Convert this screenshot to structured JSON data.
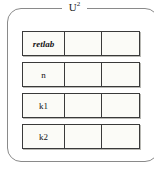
{
  "group": {
    "legend_base": "U",
    "legend_sup": "2",
    "legend_full": "U²",
    "border_color": "#8a8a8a",
    "background": "#ffffff"
  },
  "table": {
    "cell_border_color": "#3a3a3a",
    "cell_background": "#fbfbf7",
    "column_count": 3,
    "columns": [
      "",
      "",
      ""
    ],
    "rows": [
      {
        "label": "retlab",
        "label_style": "italic",
        "cells": [
          "retlab",
          "",
          ""
        ]
      },
      {
        "label": "n",
        "label_style": "normal",
        "cells": [
          "n",
          "",
          ""
        ]
      },
      {
        "label": "k1",
        "label_style": "normal",
        "cells": [
          "k1",
          "",
          ""
        ]
      },
      {
        "label": "k2",
        "label_style": "normal",
        "cells": [
          "k2",
          "",
          ""
        ]
      }
    ]
  }
}
